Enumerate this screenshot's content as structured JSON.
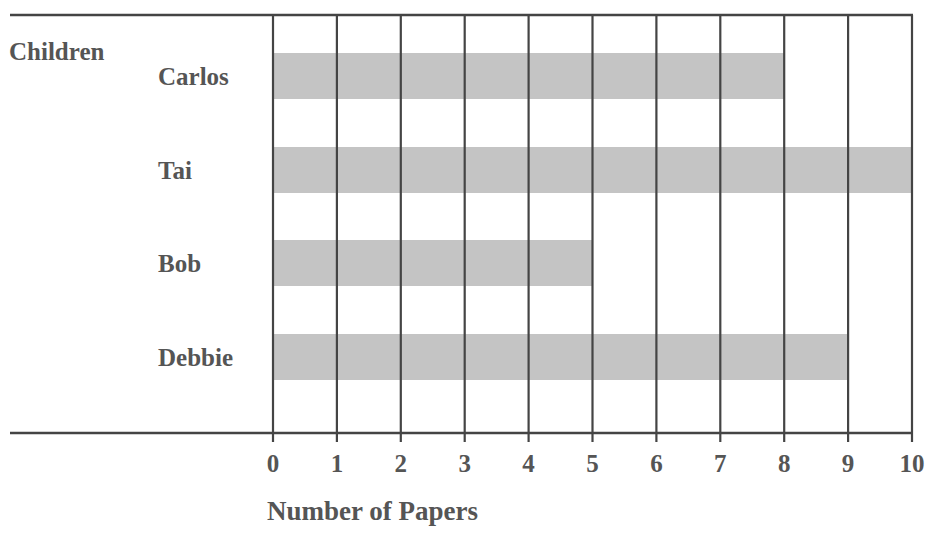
{
  "chart_data": {
    "type": "bar",
    "orientation": "horizontal",
    "title": "",
    "ylabel": "Children",
    "xlabel": "Number of Papers",
    "categories": [
      "Carlos",
      "Tai",
      "Bob",
      "Debbie"
    ],
    "values": [
      8,
      10,
      5,
      9
    ],
    "xlim": [
      0,
      10
    ],
    "xticks": [
      0,
      1,
      2,
      3,
      4,
      5,
      6,
      7,
      8,
      9,
      10
    ],
    "grid": true,
    "legend": null,
    "bar_color": "#c4c4c4",
    "line_color": "#444444",
    "text_color": "#555555"
  }
}
